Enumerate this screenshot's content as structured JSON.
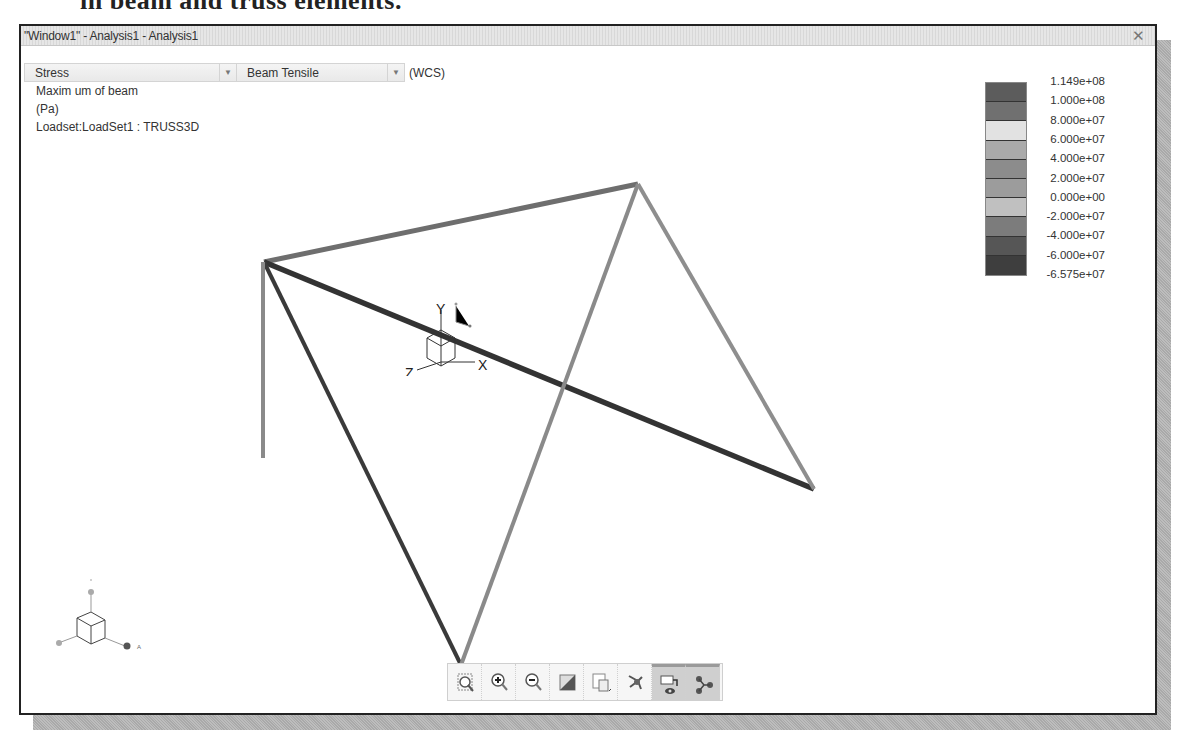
{
  "book_text": "in beam and truss elements.",
  "window": {
    "title": "\"Window1\" - Analysis1 - Analysis1",
    "close_icon": "close-x-icon"
  },
  "controls": {
    "result_type": "Stress",
    "component": "Beam Tensile",
    "coord_system": "(WCS)"
  },
  "info": {
    "line1": "Maxim um of beam",
    "line2": "(Pa)",
    "line3": "Loadset:LoadSet1 :  TRUSS3D"
  },
  "legend": {
    "labels": [
      "1.149e+08",
      "1.000e+08",
      "8.000e+07",
      "6.000e+07",
      "4.000e+07",
      "2.000e+07",
      "0.000e+00",
      "-2.000e+07",
      "-4.000e+07",
      "-6.000e+07",
      "-6.575e+07"
    ],
    "colors": [
      "#5c5c5c",
      "#707070",
      "#e2e2e2",
      "#aaaaaa",
      "#8c8c8c",
      "#9c9c9c",
      "#c0c0c0",
      "#7c7c7c",
      "#565656",
      "#3e3e3e"
    ]
  },
  "model": {
    "members": [
      {
        "from": [
          243,
          216
        ],
        "to": [
          617,
          138
        ],
        "color": "#6e6e6e",
        "width": 5
      },
      {
        "from": [
          243,
          216
        ],
        "to": [
          793,
          443
        ],
        "color": "#333333",
        "width": 5.5
      },
      {
        "from": [
          243,
          216
        ],
        "to": [
          440,
          619
        ],
        "color": "#3a3a3a",
        "width": 4
      },
      {
        "from": [
          440,
          619
        ],
        "to": [
          617,
          138
        ],
        "color": "#8a8a8a",
        "width": 4
      },
      {
        "from": [
          617,
          138
        ],
        "to": [
          793,
          443
        ],
        "color": "#8e8e8e",
        "width": 4
      },
      {
        "from": [
          242,
          216
        ],
        "to": [
          242,
          412
        ],
        "color": "#8a8a8a",
        "width": 4
      }
    ]
  },
  "triad": {
    "x_label": "X",
    "y_label": "Y",
    "z_label": "Z"
  },
  "toolbar": {
    "buttons": [
      {
        "name": "zoom-window",
        "icon": "zoom-window-icon",
        "active": false
      },
      {
        "name": "zoom-in",
        "icon": "zoom-in-icon",
        "active": false
      },
      {
        "name": "zoom-out",
        "icon": "zoom-out-icon",
        "active": false
      },
      {
        "name": "shading",
        "icon": "shading-icon",
        "active": false
      },
      {
        "name": "saved-views",
        "icon": "saved-views-icon",
        "active": false
      },
      {
        "name": "spin-center",
        "icon": "spin-center-icon",
        "active": false
      },
      {
        "name": "view-display",
        "icon": "view-display-icon",
        "active": true
      },
      {
        "name": "datum-display",
        "icon": "datum-display-icon",
        "active": true
      }
    ]
  }
}
